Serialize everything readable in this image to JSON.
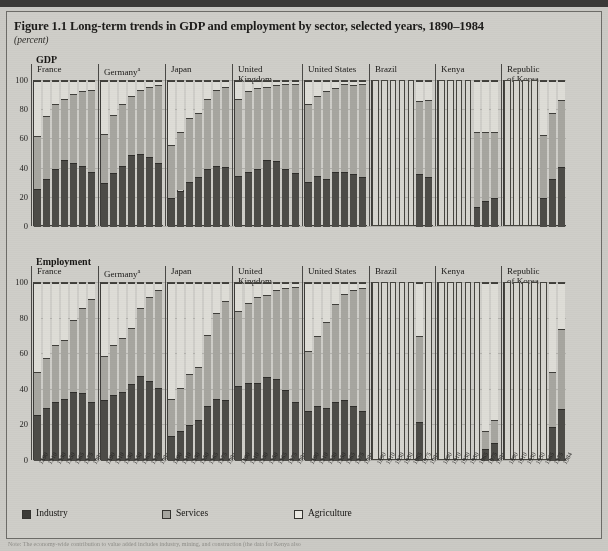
{
  "figure": {
    "title": "Figure 1.1  Long-term trends in GDP and employment by sector, selected years, 1890–1984",
    "subtitle": "(percent)",
    "section_gdp": "GDP",
    "section_employment": "Employment",
    "footnote": "Note: The economy-wide contribution to value added includes industry, mining, and construction (the data for Kenya also"
  },
  "legend": {
    "position": "bottom-left",
    "items": [
      {
        "label": "Industry",
        "color": "#3c3b37",
        "key": "industry"
      },
      {
        "label": "Services",
        "color": "#a7a6a0",
        "key": "services"
      },
      {
        "label": "Agriculture",
        "color": "#eceae4",
        "key": "agriculture"
      }
    ]
  },
  "axis": {
    "yticks": [
      0,
      20,
      40,
      60,
      80,
      100
    ],
    "ylim": [
      0,
      100
    ],
    "years": [
      "1890",
      "1910",
      "1930",
      "1950",
      "1965",
      "1975",
      "1984"
    ]
  },
  "countries": [
    {
      "key": "france",
      "label": "France",
      "superscript": ""
    },
    {
      "key": "germany",
      "label": "Germany",
      "superscript": "a"
    },
    {
      "key": "japan",
      "label": "Japan",
      "superscript": ""
    },
    {
      "key": "uk",
      "label": "United\nKingdom",
      "superscript": ""
    },
    {
      "key": "usa",
      "label": "United States",
      "superscript": ""
    },
    {
      "key": "brazil",
      "label": "Brazil",
      "superscript": ""
    },
    {
      "key": "kenya",
      "label": "Kenya",
      "superscript": ""
    },
    {
      "key": "korea",
      "label": "Republic\nof Korea",
      "superscript": ""
    }
  ],
  "chart_data": {
    "type": "bar",
    "subtype": "stacked-100-percent-small-multiples",
    "title": "Figure 1.1  Long-term trends in GDP and employment by sector, selected years, 1890–1984",
    "xlabel": "",
    "ylabel": "percent",
    "ylim": [
      0,
      100
    ],
    "yticks": [
      0,
      20,
      40,
      60,
      80,
      100
    ],
    "grid": true,
    "legend_position": "bottom-left",
    "categories": [
      "1890",
      "1910",
      "1930",
      "1950",
      "1965",
      "1975",
      "1984"
    ],
    "series_names": [
      "Industry",
      "Services",
      "Agriculture"
    ],
    "panels": [
      {
        "measure": "GDP",
        "units": "percent",
        "countries": [
          {
            "country": "France",
            "industry": [
              26,
              33,
              40,
              46,
              44,
              42,
              38
            ],
            "services": [
              36,
              43,
              44,
              42,
              47,
              51,
              56
            ],
            "agriculture": [
              38,
              24,
              16,
              12,
              9,
              7,
              6
            ]
          },
          {
            "country": "Germany",
            "industry": [
              30,
              37,
              42,
              49,
              50,
              48,
              44
            ],
            "services": [
              34,
              40,
              42,
              41,
              44,
              48,
              53
            ],
            "agriculture": [
              36,
              23,
              16,
              10,
              6,
              4,
              3
            ]
          },
          {
            "country": "Japan",
            "industry": [
              20,
              25,
              31,
              34,
              40,
              42,
              41
            ],
            "services": [
              36,
              40,
              44,
              44,
              48,
              52,
              55
            ],
            "agriculture": [
              44,
              35,
              25,
              22,
              12,
              6,
              4
            ]
          },
          {
            "country": "United Kingdom",
            "industry": [
              35,
              38,
              40,
              46,
              45,
              40,
              37
            ],
            "services": [
              53,
              55,
              55,
              50,
              52,
              58,
              61
            ],
            "agriculture": [
              12,
              7,
              5,
              4,
              3,
              2,
              2
            ]
          },
          {
            "country": "United States",
            "industry": [
              31,
              35,
              33,
              38,
              38,
              36,
              34
            ],
            "services": [
              53,
              55,
              60,
              57,
              60,
              61,
              64
            ],
            "agriculture": [
              16,
              10,
              7,
              5,
              2,
              3,
              2
            ]
          },
          {
            "country": "Brazil",
            "industry": [
              null,
              null,
              null,
              null,
              null,
              36,
              34
            ],
            "services": [
              null,
              null,
              null,
              null,
              null,
              50,
              53
            ],
            "agriculture": [
              null,
              null,
              null,
              null,
              null,
              14,
              13
            ]
          },
          {
            "country": "Kenya",
            "industry": [
              null,
              null,
              null,
              null,
              14,
              18,
              20
            ],
            "services": [
              null,
              null,
              null,
              null,
              51,
              47,
              45
            ],
            "agriculture": [
              null,
              null,
              null,
              null,
              35,
              35,
              35
            ]
          },
          {
            "country": "Republic of Korea",
            "industry": [
              null,
              null,
              null,
              null,
              20,
              33,
              41
            ],
            "services": [
              null,
              null,
              null,
              null,
              43,
              45,
              46
            ],
            "agriculture": [
              null,
              null,
              null,
              null,
              37,
              22,
              13
            ]
          }
        ]
      },
      {
        "measure": "Employment",
        "units": "percent",
        "countries": [
          {
            "country": "France",
            "industry": [
              26,
              30,
              33,
              35,
              39,
              38,
              33
            ],
            "services": [
              24,
              28,
              32,
              33,
              40,
              48,
              58
            ],
            "agriculture": [
              50,
              42,
              35,
              32,
              21,
              14,
              9
            ]
          },
          {
            "country": "Germany",
            "industry": [
              34,
              37,
              39,
              43,
              48,
              45,
              41
            ],
            "services": [
              25,
              28,
              30,
              32,
              38,
              47,
              55
            ],
            "agriculture": [
              41,
              35,
              31,
              25,
              14,
              8,
              4
            ]
          },
          {
            "country": "Japan",
            "industry": [
              14,
              17,
              20,
              23,
              31,
              35,
              34
            ],
            "services": [
              21,
              24,
              29,
              30,
              40,
              48,
              56
            ],
            "agriculture": [
              65,
              59,
              51,
              47,
              29,
              17,
              10
            ]
          },
          {
            "country": "United Kingdom",
            "industry": [
              42,
              44,
              44,
              47,
              46,
              40,
              33
            ],
            "services": [
              42,
              45,
              48,
              46,
              50,
              57,
              65
            ],
            "agriculture": [
              16,
              11,
              8,
              7,
              4,
              3,
              2
            ]
          },
          {
            "country": "United States",
            "industry": [
              28,
              31,
              30,
              33,
              34,
              31,
              28
            ],
            "services": [
              34,
              39,
              48,
              55,
              60,
              65,
              69
            ],
            "agriculture": [
              38,
              30,
              22,
              12,
              6,
              4,
              3
            ]
          },
          {
            "country": "Brazil",
            "industry": [
              null,
              null,
              null,
              null,
              null,
              22,
              null
            ],
            "services": [
              null,
              null,
              null,
              null,
              null,
              48,
              null
            ],
            "agriculture": [
              null,
              null,
              null,
              null,
              null,
              30,
              null
            ]
          },
          {
            "country": "Kenya",
            "industry": [
              null,
              null,
              null,
              null,
              null,
              7,
              10
            ],
            "services": [
              null,
              null,
              null,
              null,
              null,
              10,
              13
            ],
            "agriculture": [
              null,
              null,
              null,
              null,
              null,
              83,
              77
            ]
          },
          {
            "country": "Republic of Korea",
            "industry": [
              null,
              null,
              null,
              null,
              null,
              19,
              29
            ],
            "services": [
              null,
              null,
              null,
              null,
              null,
              31,
              45
            ],
            "agriculture": [
              null,
              null,
              null,
              null,
              null,
              50,
              26
            ]
          }
        ]
      }
    ]
  }
}
